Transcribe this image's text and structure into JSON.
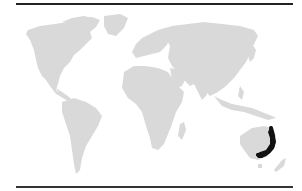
{
  "map": {
    "type": "world-distribution-map",
    "projection": "equirectangular-like",
    "land_color": "#d9d9d9",
    "ocean_color": "#ffffff",
    "range_color": "#111111",
    "rule_color": "#222222",
    "highlighted_region": {
      "name": "eastern Australia coastal range",
      "shape": "J-shaped band along east coast, curving west at south"
    },
    "continents": [
      "North America",
      "Greenland",
      "South America",
      "Europe",
      "Asia",
      "Africa",
      "Madagascar",
      "Australia",
      "New Zealand",
      "Southeast Asia islands",
      "Japan"
    ]
  }
}
